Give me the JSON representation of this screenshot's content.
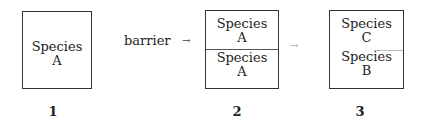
{
  "diagram": {
    "stages": [
      {
        "number": "1",
        "cells": [
          {
            "line1": "Species",
            "line2": "A"
          }
        ]
      },
      {
        "number": "2",
        "cells": [
          {
            "line1": "Species",
            "line2": "A"
          },
          {
            "line1": "Species",
            "line2": "A"
          }
        ]
      },
      {
        "number": "3",
        "cells": [
          {
            "line1": "Species",
            "line2": "C"
          },
          {
            "line1": "Species",
            "line2": "B"
          }
        ]
      }
    ],
    "barrier_label": "barrier",
    "arrow_glyph": "→"
  }
}
